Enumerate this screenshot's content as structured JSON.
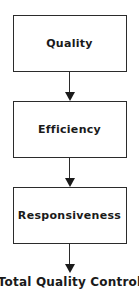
{
  "flowchart": {
    "title": "Total Quality Control flow diagram",
    "nodes": [
      {
        "id": "quality",
        "label": "Quality"
      },
      {
        "id": "efficiency",
        "label": "Efficiency"
      },
      {
        "id": "responsiveness",
        "label": "Responsiveness"
      }
    ],
    "connectors": [
      {
        "from": "quality",
        "to": "efficiency",
        "style": "arrow-down"
      },
      {
        "from": "efficiency",
        "to": "responsiveness",
        "style": "arrow-down"
      },
      {
        "from": "responsiveness",
        "to": "result",
        "style": "arrow-down"
      }
    ],
    "result_label": "Total Quality Control",
    "colors": {
      "background": "#ffffff",
      "box_border": "#2b2b2b",
      "text": "#1a1a1a",
      "arrow": "#1a1a1a"
    }
  }
}
